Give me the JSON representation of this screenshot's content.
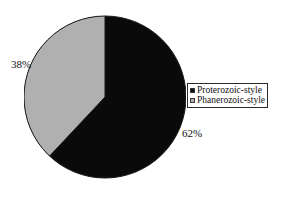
{
  "figure": {
    "background_color": "#ffffff",
    "width": 291,
    "height": 197,
    "title_remnant": "Proterozoic-style vs Phanerozoic-style"
  },
  "pie": {
    "center_x": 81,
    "center_y": 87,
    "radius": 81,
    "start_angle_deg": 0,
    "direction": "clockwise",
    "outline_color": "#1a1a1a"
  },
  "labels": {
    "left_pct": "38%",
    "right_pct": "62%"
  },
  "legend": {
    "border_color": "#2a2a2a",
    "background_color": "#ffffff",
    "items": [
      {
        "label": "Proterozoic-style",
        "color": "#0a0a0a"
      },
      {
        "label": "Phanerozoic-style",
        "color": "#b0b0b0"
      }
    ]
  },
  "chart_data": {
    "type": "pie",
    "title": "",
    "subtitle": "",
    "xlabel": "",
    "ylabel": "",
    "grid": false,
    "legend_position": "right",
    "start_angle_deg": 90,
    "direction": "clockwise",
    "categories": [
      "Proterozoic-style",
      "Phanerozoic-style"
    ],
    "values": [
      62,
      38
    ],
    "value_unit": "percent",
    "data_labels": [
      "62%",
      "38%"
    ],
    "colors": [
      "#0a0a0a",
      "#b0b0b0"
    ],
    "slices": [
      {
        "name": "Proterozoic-style",
        "value": 62,
        "label": "62%",
        "color": "#0a0a0a",
        "start_deg": 0,
        "sweep_deg": 223.2,
        "label_position": "outside-right"
      },
      {
        "name": "Phanerozoic-style",
        "value": 38,
        "label": "38%",
        "color": "#b0b0b0",
        "start_deg": 223.2,
        "sweep_deg": 136.8,
        "label_position": "outside-left"
      }
    ]
  }
}
